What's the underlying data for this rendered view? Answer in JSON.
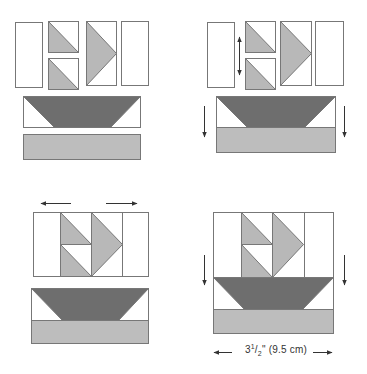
{
  "diagram": {
    "type": "quilt-block-assembly",
    "colors": {
      "outline": "#777777",
      "background_fabric": "#ffffff",
      "sail_fabric": "#b8b8b8",
      "hull_fabric": "#6e6e6e",
      "water_fabric": "#bdbdbd",
      "arrow": "#333333"
    },
    "steps": [
      {
        "id": "step-1",
        "description": "Lay out all pieces: side strips, two half-square triangles, large sail unit, hull unit and water strip"
      },
      {
        "id": "step-2",
        "description": "Join the two half-square triangles vertically; join hull unit to water strip",
        "arrows": [
          "vertical-double",
          "down-left",
          "down-right"
        ]
      },
      {
        "id": "step-3",
        "description": "Join sail row pieces horizontally with side strips",
        "arrows": [
          "left",
          "right"
        ]
      },
      {
        "id": "step-4",
        "description": "Join sail row to hull unit to complete block",
        "arrows": [
          "down-left",
          "down-right"
        ]
      }
    ],
    "dimension": {
      "whole": "3",
      "numerator": "1",
      "denominator": "2",
      "unit_imperial": "\"",
      "metric": "(9.5 cm)",
      "full_text": "3 1/2\" (9.5 cm)"
    }
  }
}
